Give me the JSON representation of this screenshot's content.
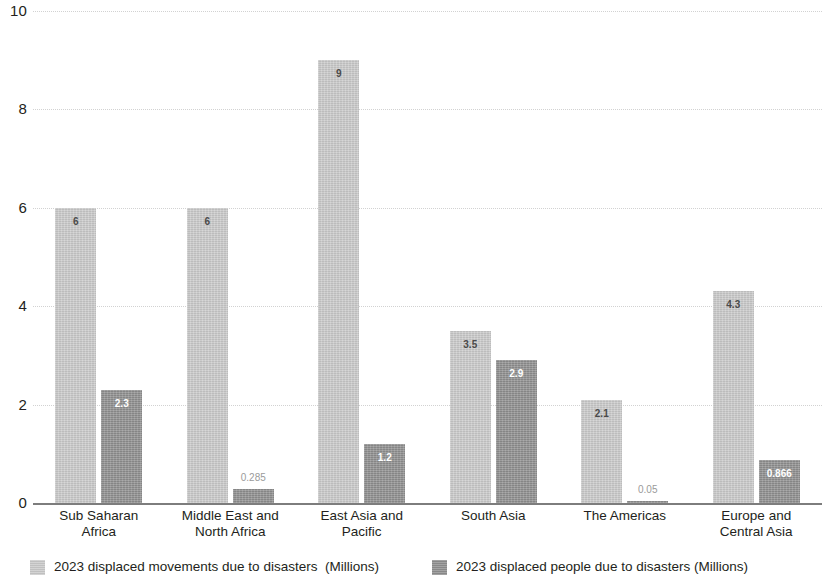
{
  "chart_data": {
    "type": "bar",
    "title": "",
    "subtitle": "",
    "xlabel": "",
    "ylabel": "",
    "ylim": [
      0,
      10
    ],
    "y_ticks": [
      0,
      2,
      4,
      6,
      8,
      10
    ],
    "y_tick_labels": [
      "0",
      "2",
      "4",
      "6",
      "8",
      "10"
    ],
    "grid": true,
    "grid_axis": "y",
    "legend_position": "bottom",
    "categories": [
      "Sub Saharan\nAfrica",
      "Middle East and\nNorth Africa",
      "East Asia and\nPacific",
      "South Asia",
      "The Americas",
      "Europe and\nCentral Asia"
    ],
    "category_lines": [
      [
        "Sub Saharan",
        "Africa"
      ],
      [
        "Middle East and",
        "North Africa"
      ],
      [
        "East Asia and",
        "Pacific"
      ],
      [
        "South Asia",
        ""
      ],
      [
        "The Americas",
        ""
      ],
      [
        "Europe and",
        "Central Asia"
      ]
    ],
    "series": [
      {
        "name": "2023 displaced movements due to disasters  (Millions)",
        "color": "#cacaca",
        "values": [
          6,
          6,
          9,
          3.5,
          2.1,
          4.3
        ],
        "labels": [
          "6",
          "6",
          "9",
          "3.5",
          "2.1",
          "4.3"
        ]
      },
      {
        "name": "2023 displaced people due to disasters (Millions)",
        "color": "#8f8f8f",
        "values": [
          2.3,
          0.285,
          1.2,
          2.9,
          0.05,
          0.866
        ],
        "labels": [
          "2.3",
          "0.285",
          "1.2",
          "2.9",
          "0.05",
          "0.866"
        ]
      }
    ]
  },
  "legend": {
    "items": [
      {
        "label": "2023 displaced movements due to disasters  (Millions)",
        "swatch": "series-a"
      },
      {
        "label": "2023 displaced people due to disasters (Millions)",
        "swatch": "series-b"
      }
    ]
  },
  "colors": {
    "series_a": "#cacaca",
    "series_b": "#8f8f8f",
    "axis": "#7d7d7d",
    "grid": "#d2d2d2",
    "text": "#231f20",
    "background": "#ffffff"
  }
}
